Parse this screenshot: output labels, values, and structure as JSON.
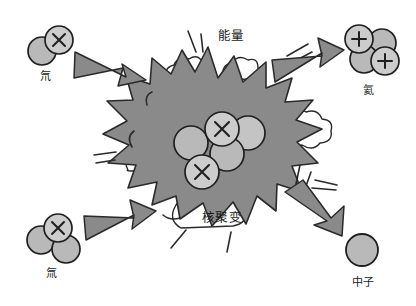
{
  "diagram": {
    "title_text": "核聚变",
    "energy_text": "能量",
    "background_color": "#ffffff",
    "ink_color": "#1a1a1a",
    "burst_fill": "#8a8a8a",
    "particle_fill": "#b9b9b9",
    "particle_light_fill": "#cccccc",
    "arrow_fill": "#8a8a8a"
  },
  "reactants": [
    {
      "id": "deuterium",
      "label": "氘",
      "position": "top-left",
      "nucleon_count": 2,
      "protons": 1,
      "neutrons": 1,
      "proton_symbol": "×"
    },
    {
      "id": "tritium",
      "label": "氚",
      "position": "bottom-left",
      "nucleon_count": 3,
      "protons": 1,
      "neutrons": 2,
      "proton_symbol": "×"
    }
  ],
  "products": [
    {
      "id": "helium",
      "label": "氦",
      "position": "top-right",
      "nucleon_count": 4,
      "protons": 2,
      "neutrons": 2,
      "proton_symbol": "+"
    },
    {
      "id": "neutron",
      "label": "中子",
      "position": "bottom-right",
      "nucleon_count": 1,
      "protons": 0,
      "neutrons": 1,
      "proton_symbol": ""
    }
  ],
  "core": {
    "label": "核聚变",
    "nucleon_count": 5,
    "protons": 2,
    "neutrons": 3,
    "proton_symbol": "+"
  },
  "energy": {
    "label": "能量"
  },
  "arrows": [
    {
      "id": "arrow-deuterium-in",
      "direction": "down-right",
      "role": "input"
    },
    {
      "id": "arrow-tritium-in",
      "direction": "up-right",
      "role": "input"
    },
    {
      "id": "arrow-helium-out",
      "direction": "up-right",
      "role": "output"
    },
    {
      "id": "arrow-neutron-out",
      "direction": "down-right",
      "role": "output"
    }
  ]
}
